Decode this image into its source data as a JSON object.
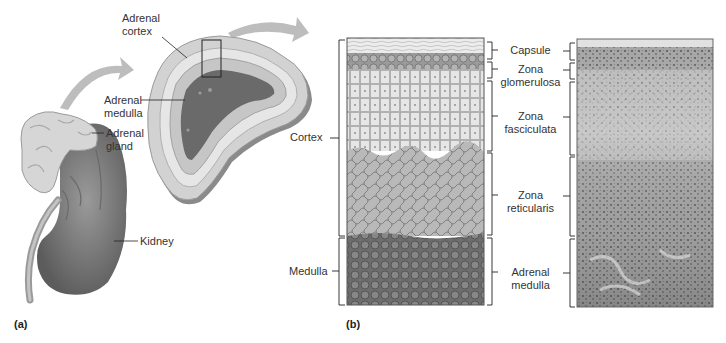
{
  "figure": {
    "panel_a": {
      "tag": "(a)",
      "labels": {
        "adrenal_cortex": "Adrenal\ncortex",
        "adrenal_medulla": "Adrenal\nmedulla",
        "adrenal_gland": "Adrenal\ngland",
        "kidney": "Kidney"
      }
    },
    "panel_b": {
      "tag": "(b)",
      "left_labels": {
        "cortex": "Cortex",
        "medulla": "Medulla"
      },
      "zones": [
        {
          "line1": "Capsule",
          "line2": ""
        },
        {
          "line1": "Zona",
          "line2": "glomerulosa"
        },
        {
          "line1": "Zona",
          "line2": "fasciculata"
        },
        {
          "line1": "Zona",
          "line2": "reticularis"
        },
        {
          "line1": "Adrenal",
          "line2": "medulla"
        }
      ]
    }
  }
}
